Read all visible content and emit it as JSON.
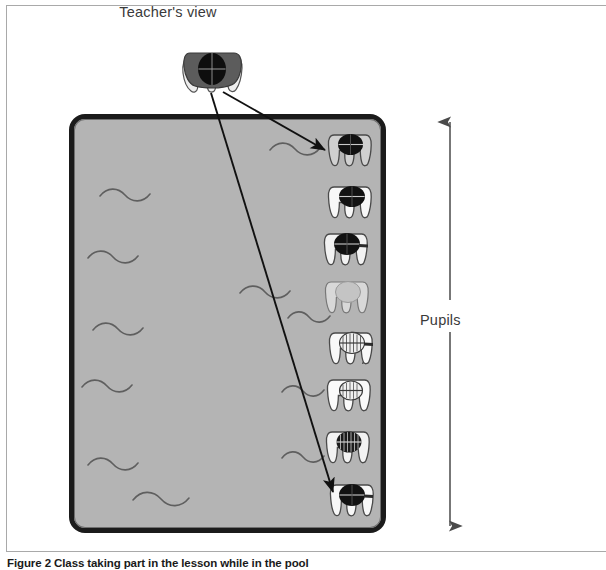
{
  "figure": {
    "title": "Teacher's view",
    "caption_lead": "Figure 2",
    "caption_rest": "Class taking part in the lesson while in the pool",
    "pupils_label": "Pupils"
  },
  "colors": {
    "pool_fill": "#b4b4b4",
    "pool_border": "#1b1b1b",
    "wave_stroke": "#5f5f5f",
    "frame_border": "#a9a9a9",
    "text": "#3a3a3a",
    "caption_text": "#1a1a1a",
    "figure_dark": "#141414",
    "figure_light": "#f4f4f4",
    "figure_outline": "#4a4a4a",
    "arrow": "#111111"
  },
  "pool": {
    "x": 69,
    "y": 114,
    "width": 317,
    "height": 419,
    "corner_radius": 16,
    "border_width": 5
  },
  "waves": [
    {
      "x": 120,
      "y": 190
    },
    {
      "x": 278,
      "y": 148
    },
    {
      "x": 104,
      "y": 254
    },
    {
      "x": 253,
      "y": 290
    },
    {
      "x": 296,
      "y": 316
    },
    {
      "x": 110,
      "y": 327
    },
    {
      "x": 96,
      "y": 383
    },
    {
      "x": 288,
      "y": 389
    },
    {
      "x": 104,
      "y": 461
    },
    {
      "x": 288,
      "y": 455
    },
    {
      "x": 156,
      "y": 497
    }
  ],
  "teacher": {
    "x": 214,
    "y": 65,
    "label": "teacher-figure",
    "tone": "dark"
  },
  "pupils": [
    {
      "index": 1,
      "x": 351,
      "y": 150,
      "tone": "dark"
    },
    {
      "index": 2,
      "x": 351,
      "y": 202,
      "tone": "dark"
    },
    {
      "index": 3,
      "x": 347,
      "y": 249,
      "tone": "dark"
    },
    {
      "index": 4,
      "x": 348,
      "y": 297,
      "tone": "empty"
    },
    {
      "index": 5,
      "x": 352,
      "y": 348,
      "tone": "light"
    },
    {
      "index": 6,
      "x": 350,
      "y": 395,
      "tone": "light"
    },
    {
      "index": 7,
      "x": 349,
      "y": 447,
      "tone": "mid"
    },
    {
      "index": 8,
      "x": 353,
      "y": 500,
      "tone": "dark"
    }
  ],
  "sight_arrows": [
    {
      "name": "teacher-to-near-pupil",
      "x1": 223,
      "y1": 92,
      "x2": 326,
      "y2": 150
    },
    {
      "name": "teacher-to-far-pupil",
      "x1": 212,
      "y1": 93,
      "x2": 334,
      "y2": 494
    }
  ],
  "pupils_range_arrow": {
    "x": 450,
    "top_y": 120,
    "bottom_y": 528,
    "gap_top": 300,
    "gap_bottom": 330,
    "double_headed": true
  }
}
